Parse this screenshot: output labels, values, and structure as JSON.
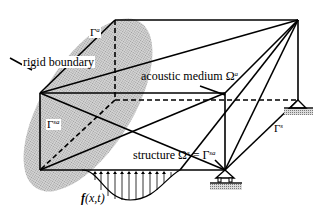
{
  "figure": {
    "labels": {
      "rigid_boundary": "rigid boundary",
      "gamma_a_base": "Γ",
      "gamma_a_sup": "a",
      "gamma_sa_base": "Γ",
      "gamma_sa_sup": "sa",
      "acoustic_medium_text": "acoustic medium Ω",
      "acoustic_medium_sup": "a",
      "structure_text": "structure Ω",
      "structure_sup": "s",
      "structure_eq": " = Γ",
      "structure_eq_sup": "sa",
      "gamma_s_base": "Γ",
      "gamma_s_sup": "s",
      "load_f": "f",
      "load_args": "(x,t)"
    },
    "colors": {
      "line": "#000000",
      "ellipse_fill": "#c8c8c8",
      "ground_hatch": "#b0b0b0",
      "background": "#ffffff"
    }
  }
}
